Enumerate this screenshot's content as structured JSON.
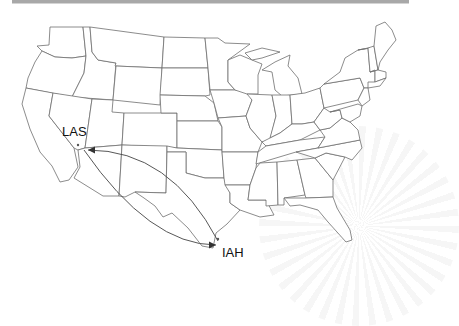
{
  "map": {
    "title": "US flight route map",
    "airports": [
      {
        "code": "LAS",
        "city_hint": "Las Vegas"
      },
      {
        "code": "IAH",
        "city_hint": "Houston"
      }
    ],
    "routes": [
      {
        "from": "LAS",
        "to": "IAH",
        "direction": "outbound"
      },
      {
        "from": "IAH",
        "to": "LAS",
        "direction": "return"
      }
    ],
    "colors": {
      "state_stroke": "#6e6e6e",
      "route_stroke": "#444444",
      "background": "#ffffff"
    }
  }
}
